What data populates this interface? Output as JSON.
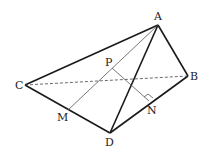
{
  "diagram": {
    "type": "tetrahedron",
    "labels": {
      "A": "A",
      "B": "B",
      "C": "C",
      "D": "D",
      "M": "M",
      "N": "N",
      "P": "P"
    },
    "edges_solid": [
      "AC",
      "AB",
      "AD",
      "CD",
      "BD"
    ],
    "edges_hidden": [
      "CB"
    ],
    "auxiliary_segments": [
      "AM",
      "PN"
    ],
    "right_angle_at": "N"
  }
}
